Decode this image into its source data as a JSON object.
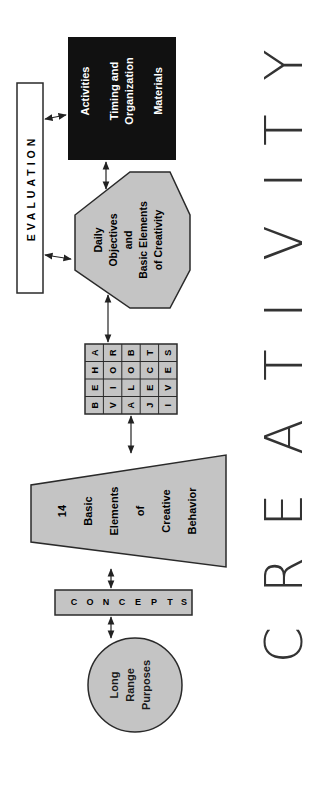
{
  "diagram": {
    "title": "CREATIVITY",
    "title_letters": [
      "C",
      "R",
      "E",
      "A",
      "T",
      "I",
      "V",
      "I",
      "T",
      "Y"
    ],
    "nodes": {
      "long_range": {
        "lines": [
          "Long",
          "Range",
          "Purposes"
        ],
        "shape": "circle"
      },
      "concepts": {
        "letters": [
          "C",
          "O",
          "N",
          "C",
          "E",
          "P",
          "T",
          "S"
        ],
        "shape": "rectangle"
      },
      "basic_elements": {
        "lines": [
          "14",
          "Basic",
          "Elements",
          "of",
          "Creative",
          "Behavior"
        ],
        "shape": "trapezoid"
      },
      "behavioral_objectives": {
        "shape": "grid",
        "rows": [
          [
            "B",
            "E",
            "H",
            "A"
          ],
          [
            "V",
            "I",
            "O",
            "R"
          ],
          [
            "A",
            "L",
            "O",
            "B"
          ],
          [
            "J",
            "E",
            "C",
            "T"
          ],
          [
            "I",
            "V",
            "E",
            "S"
          ]
        ]
      },
      "daily_objectives": {
        "lines": [
          "Daily",
          "Objectives",
          "and",
          "Basic Elements",
          "of Creativity"
        ],
        "shape": "octagon"
      },
      "activities": {
        "lines": [
          "Activities",
          "Timing and",
          "Organization",
          "Materials"
        ],
        "shape": "black-rectangle"
      },
      "evaluation": {
        "label": "EVALUATION",
        "letters": [
          "E",
          "V",
          "A",
          "L",
          "U",
          "A",
          "T",
          "I",
          "O",
          "N"
        ],
        "shape": "rectangle"
      }
    },
    "edges": [
      {
        "from": "long_range",
        "to": "concepts",
        "type": "bidirectional"
      },
      {
        "from": "concepts",
        "to": "basic_elements",
        "type": "bidirectional"
      },
      {
        "from": "basic_elements",
        "to": "behavioral_objectives",
        "type": "bidirectional"
      },
      {
        "from": "behavioral_objectives",
        "to": "daily_objectives",
        "type": "bidirectional"
      },
      {
        "from": "daily_objectives",
        "to": "activities",
        "type": "bidirectional"
      },
      {
        "from": "daily_objectives",
        "to": "evaluation",
        "type": "bidirectional"
      },
      {
        "from": "activities",
        "to": "evaluation",
        "type": "bidirectional"
      }
    ],
    "colors": {
      "shape_fill": "#c4c4c4",
      "black_box": "#111111",
      "stroke": "#2a2a2a",
      "title": "#333333"
    }
  }
}
